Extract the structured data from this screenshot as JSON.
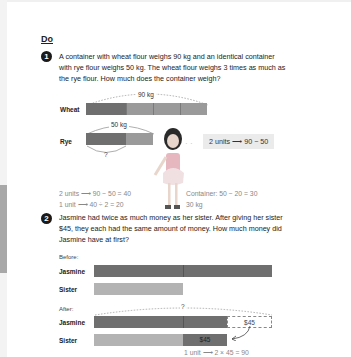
{
  "section": {
    "heading": "Do"
  },
  "problem1": {
    "number": "1",
    "text_lines": [
      "A container with wheat flour weighs 90 kg and an identical container",
      "with rye flour weighs 50 kg. The wheat flour weighs 3 times as much as",
      "the rye flour. How much does the container weigh?"
    ],
    "diagram": {
      "wheat_label": "Wheat",
      "rye_label": "Rye",
      "wheat_total": "90 kg",
      "rye_total": "50 kg",
      "unknown": "?",
      "callout": "2 units ⟶ 90 − 50"
    },
    "working": {
      "line1": "2 units ⟶ 90 − 50 = 40",
      "line2": "1 unit ⟶ 40 ÷ 2 = 20",
      "line3": "Container: 50 − 20 = 30",
      "answer": "30 kg"
    }
  },
  "problem2": {
    "number": "2",
    "text_lines": [
      "Jasmine had twice as much money as her sister. After giving her sister",
      "$45, they each had the same amount of money. How much money did",
      "Jasmine have at first?"
    ],
    "before_label": "Before:",
    "after_label": "After:",
    "jasmine_label": "Jasmine",
    "sister_label": "Sister",
    "unknown": "?",
    "transfer_amount": "$45",
    "received_amount": "$45",
    "working_line1": "1 unit ⟶ 2 × 45 = 90"
  },
  "colors": {
    "dark_bar": "#6f6f6f",
    "light_bar": "#b3b3b3",
    "callout_bg": "#ebebeb"
  }
}
